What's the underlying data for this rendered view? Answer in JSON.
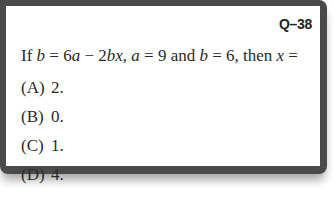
{
  "question": {
    "id": "Q–38",
    "stem_parts": {
      "p1": "If ",
      "b1": "b",
      "p2": " = 6",
      "a1": "a",
      "p3": " − 2",
      "bx": "bx",
      "p4": ", ",
      "a2": "a",
      "p5": " = 9 and ",
      "b2": "b",
      "p6": " = 6, then ",
      "x": "x",
      "p7": " ="
    },
    "stem_full": "If b = 6a − 2bx, a = 9 and b = 6, then x =",
    "options": [
      {
        "letter": "(A)",
        "value": "2."
      },
      {
        "letter": "(B)",
        "value": "0."
      },
      {
        "letter": "(C)",
        "value": "1."
      },
      {
        "letter": "(D)",
        "value": "4."
      }
    ]
  },
  "colors": {
    "frame": "#4a4a4a",
    "background": "#ffffff",
    "text": "#2a2a2a"
  }
}
